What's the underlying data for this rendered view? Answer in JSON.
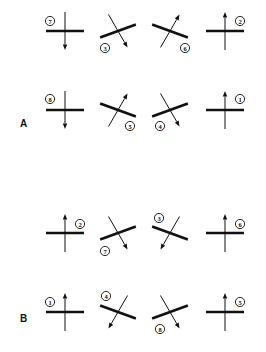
{
  "panels": [
    {
      "letter": "A",
      "letter_pos": [
        20,
        127
      ],
      "symbols": [
        {
          "cx": 65,
          "cy": 31,
          "bar_angle": 0,
          "arrow_angle": 90,
          "label": "7",
          "label_pos": [
            50,
            21
          ]
        },
        {
          "cx": 118,
          "cy": 31,
          "bar_angle": -20,
          "arrow_angle": 60,
          "label": "3",
          "label_pos": [
            105,
            48
          ]
        },
        {
          "cx": 170,
          "cy": 31,
          "bar_angle": 20,
          "arrow_angle": -60,
          "label": "6",
          "label_pos": [
            185,
            48
          ]
        },
        {
          "cx": 225,
          "cy": 31,
          "bar_angle": 0,
          "arrow_angle": -90,
          "label": "2",
          "label_pos": [
            240,
            21
          ]
        },
        {
          "cx": 65,
          "cy": 110,
          "bar_angle": 0,
          "arrow_angle": 90,
          "label": "8",
          "label_pos": [
            50,
            99
          ]
        },
        {
          "cx": 118,
          "cy": 110,
          "bar_angle": 20,
          "arrow_angle": -60,
          "label": "5",
          "label_pos": [
            130,
            126
          ]
        },
        {
          "cx": 170,
          "cy": 110,
          "bar_angle": -20,
          "arrow_angle": 60,
          "label": "4",
          "label_pos": [
            160,
            126
          ]
        },
        {
          "cx": 225,
          "cy": 110,
          "bar_angle": 0,
          "arrow_angle": -90,
          "label": "1",
          "label_pos": [
            240,
            99
          ]
        }
      ]
    },
    {
      "letter": "B",
      "letter_pos": [
        20,
        322
      ],
      "symbols": [
        {
          "cx": 65,
          "cy": 233,
          "bar_angle": 0,
          "arrow_angle": -90,
          "label": "2",
          "label_pos": [
            80,
            224
          ]
        },
        {
          "cx": 118,
          "cy": 233,
          "bar_angle": -20,
          "arrow_angle": 60,
          "label": "7",
          "label_pos": [
            105,
            251
          ]
        },
        {
          "cx": 170,
          "cy": 233,
          "bar_angle": 20,
          "arrow_angle": 120,
          "label": "3",
          "label_pos": [
            159,
            218
          ]
        },
        {
          "cx": 225,
          "cy": 233,
          "bar_angle": 0,
          "arrow_angle": -90,
          "label": "6",
          "label_pos": [
            240,
            224
          ]
        },
        {
          "cx": 65,
          "cy": 312,
          "bar_angle": 0,
          "arrow_angle": -90,
          "label": "1",
          "label_pos": [
            50,
            302
          ]
        },
        {
          "cx": 118,
          "cy": 312,
          "bar_angle": 20,
          "arrow_angle": 120,
          "label": "4",
          "label_pos": [
            106,
            296
          ]
        },
        {
          "cx": 170,
          "cy": 312,
          "bar_angle": -20,
          "arrow_angle": 60,
          "label": "8",
          "label_pos": [
            160,
            329
          ]
        },
        {
          "cx": 225,
          "cy": 312,
          "bar_angle": 0,
          "arrow_angle": -90,
          "label": "5",
          "label_pos": [
            240,
            302
          ]
        }
      ]
    }
  ],
  "style": {
    "ink": "#111111",
    "background": "#ffffff",
    "bar_half_length": 19,
    "shaft_half_length": 19
  }
}
